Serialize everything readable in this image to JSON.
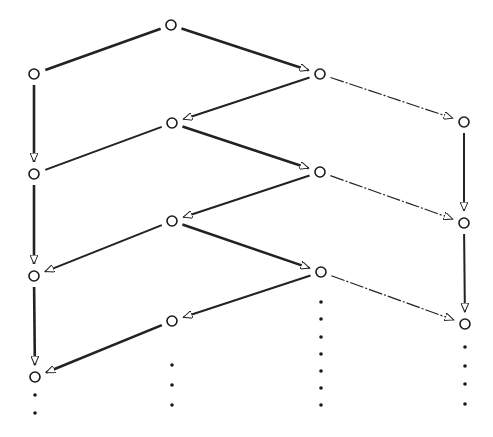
{
  "diagram": {
    "type": "directed-lattice",
    "width": 493,
    "height": 437,
    "colors": {
      "background": "#ffffff",
      "stroke": "#222222",
      "node": "#1a1a1a",
      "dot": "#1a1a1a"
    },
    "node_radius": 5,
    "nodes": [
      {
        "id": "n0",
        "x": 171,
        "y": 25
      },
      {
        "id": "a1",
        "x": 34,
        "y": 74
      },
      {
        "id": "c1",
        "x": 320,
        "y": 74
      },
      {
        "id": "b1",
        "x": 172,
        "y": 123
      },
      {
        "id": "d1",
        "x": 464,
        "y": 122
      },
      {
        "id": "a2",
        "x": 34,
        "y": 174
      },
      {
        "id": "c2",
        "x": 320,
        "y": 172
      },
      {
        "id": "b2",
        "x": 172,
        "y": 221
      },
      {
        "id": "d2",
        "x": 464,
        "y": 223
      },
      {
        "id": "a3",
        "x": 34,
        "y": 276
      },
      {
        "id": "c3",
        "x": 321,
        "y": 272
      },
      {
        "id": "b3",
        "x": 172,
        "y": 321
      },
      {
        "id": "d3",
        "x": 465,
        "y": 324
      },
      {
        "id": "a4",
        "x": 35,
        "y": 377
      }
    ],
    "edges": [
      {
        "from": "n0",
        "to": "a1",
        "arrow": false,
        "style": "double"
      },
      {
        "from": "n0",
        "to": "c1",
        "arrow": true,
        "style": "double"
      },
      {
        "from": "a1",
        "to": "a2",
        "arrow": true,
        "style": "double"
      },
      {
        "from": "c1",
        "to": "b1",
        "arrow": true,
        "style": "solid"
      },
      {
        "from": "c1",
        "to": "d1",
        "arrow": true,
        "style": "thin"
      },
      {
        "from": "b1",
        "to": "a2",
        "arrow": false,
        "style": "solid"
      },
      {
        "from": "b1",
        "to": "c2",
        "arrow": true,
        "style": "double"
      },
      {
        "from": "d1",
        "to": "d2",
        "arrow": true,
        "style": "solid"
      },
      {
        "from": "a2",
        "to": "a3",
        "arrow": true,
        "style": "double"
      },
      {
        "from": "c2",
        "to": "b2",
        "arrow": true,
        "style": "solid"
      },
      {
        "from": "c2",
        "to": "d2",
        "arrow": true,
        "style": "thin"
      },
      {
        "from": "b2",
        "to": "a3",
        "arrow": true,
        "style": "solid"
      },
      {
        "from": "b2",
        "to": "c3",
        "arrow": true,
        "style": "double"
      },
      {
        "from": "d2",
        "to": "d3",
        "arrow": true,
        "style": "solid"
      },
      {
        "from": "a3",
        "to": "a4",
        "arrow": true,
        "style": "double"
      },
      {
        "from": "c3",
        "to": "b3",
        "arrow": true,
        "style": "solid"
      },
      {
        "from": "c3",
        "to": "d3",
        "arrow": true,
        "style": "thin"
      },
      {
        "from": "b3",
        "to": "a4",
        "arrow": true,
        "style": "double"
      }
    ],
    "ellipsis_dots": [
      {
        "column": "a",
        "x": 35,
        "ys": [
          395,
          413
        ]
      },
      {
        "column": "b",
        "x": 172,
        "ys": [
          365,
          385,
          405
        ]
      },
      {
        "column": "c",
        "x": 321,
        "ys": [
          302,
          319,
          337,
          354,
          371,
          388,
          405
        ]
      },
      {
        "column": "d",
        "x": 465,
        "ys": [
          347,
          366,
          384,
          404
        ]
      }
    ]
  }
}
